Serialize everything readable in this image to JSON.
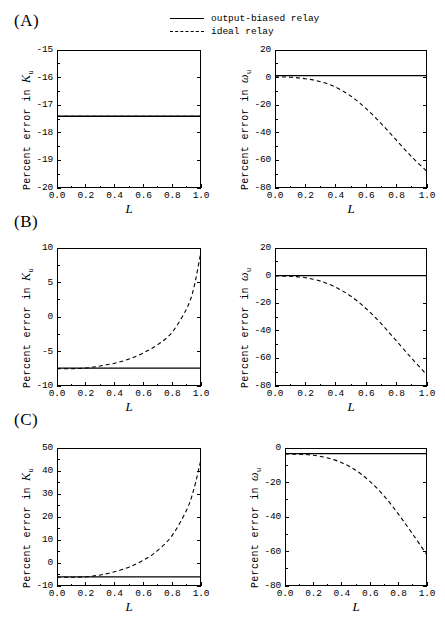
{
  "figure": {
    "legend": {
      "entries": [
        {
          "label": "output-biased relay",
          "style": "solid"
        },
        {
          "label": "ideal relay",
          "style": "dashed"
        }
      ]
    },
    "panels": [
      {
        "id": "A",
        "label": "(A)"
      },
      {
        "id": "B",
        "label": "(B)"
      },
      {
        "id": "C",
        "label": "(C)"
      }
    ]
  },
  "chart_data": [
    {
      "id": "A-left",
      "panel": "(A)",
      "type": "line",
      "title": "",
      "xlabel": "L",
      "ylabel": "Percent error in K_u",
      "ylabel_text": "Percent error in ",
      "ylabel_symbol": "K",
      "ylabel_subscript": "u",
      "xlim": [
        0.0,
        1.0
      ],
      "ylim": [
        -20,
        -15
      ],
      "xticks": [
        0.0,
        0.2,
        0.4,
        0.6,
        0.8,
        1.0
      ],
      "xtick_labels": [
        "0.0",
        "0.2",
        "0.4",
        "0.6",
        "0.8",
        "1.0"
      ],
      "yticks": [
        -20,
        -19,
        -18,
        -17,
        -16,
        -15
      ],
      "ytick_labels": [
        "-20",
        "-19",
        "-18",
        "-17",
        "-16",
        "-15"
      ],
      "grid": false,
      "legend_position": "figure-top",
      "x": [
        0.0,
        0.1,
        0.2,
        0.3,
        0.4,
        0.5,
        0.6,
        0.7,
        0.8,
        0.9,
        1.0
      ],
      "series": [
        {
          "name": "output-biased relay",
          "style": "solid",
          "values": [
            -17.4,
            -17.4,
            -17.4,
            -17.4,
            -17.4,
            -17.4,
            -17.4,
            -17.4,
            -17.4,
            -17.4,
            -17.4
          ]
        },
        {
          "name": "ideal relay",
          "style": "dashed",
          "values": [
            -17.4,
            -17.4,
            -17.4,
            -17.4,
            -17.4,
            -17.4,
            -17.4,
            -17.4,
            -17.4,
            -17.4,
            -17.4
          ]
        }
      ]
    },
    {
      "id": "A-right",
      "panel": "(A)",
      "type": "line",
      "title": "",
      "xlabel": "L",
      "ylabel": "Percent error in omega_u",
      "ylabel_text": "Percent error in ",
      "ylabel_symbol": "ω",
      "ylabel_subscript": "u",
      "xlim": [
        0.0,
        1.0
      ],
      "ylim": [
        -80,
        20
      ],
      "xticks": [
        0.0,
        0.2,
        0.4,
        0.6,
        0.8,
        1.0
      ],
      "xtick_labels": [
        "0.0",
        "0.2",
        "0.4",
        "0.6",
        "0.8",
        "1.0"
      ],
      "yticks": [
        -80,
        -60,
        -40,
        -20,
        0,
        20
      ],
      "ytick_labels": [
        "-80",
        "-60",
        "-40",
        "-20",
        "0",
        "20"
      ],
      "grid": false,
      "legend_position": "figure-top",
      "x": [
        0.0,
        0.1,
        0.2,
        0.3,
        0.4,
        0.5,
        0.6,
        0.7,
        0.8,
        0.9,
        1.0
      ],
      "series": [
        {
          "name": "output-biased relay",
          "style": "solid",
          "values": [
            1.5,
            1.5,
            1.5,
            1.5,
            1.5,
            1.5,
            1.5,
            1.5,
            1.5,
            1.5,
            1.5
          ]
        },
        {
          "name": "ideal relay",
          "style": "dashed",
          "values": [
            0.5,
            0.3,
            -0.8,
            -3.0,
            -7.0,
            -13.5,
            -22.5,
            -33.5,
            -45.5,
            -57.5,
            -68.0
          ]
        }
      ]
    },
    {
      "id": "B-left",
      "panel": "(B)",
      "type": "line",
      "title": "",
      "xlabel": "L",
      "ylabel": "Percent error in K_u",
      "ylabel_text": "Percent error in ",
      "ylabel_symbol": "K",
      "ylabel_subscript": "u",
      "xlim": [
        0.0,
        1.0
      ],
      "ylim": [
        -10,
        10
      ],
      "xticks": [
        0.0,
        0.2,
        0.4,
        0.6,
        0.8,
        1.0
      ],
      "xtick_labels": [
        "0.0",
        "0.2",
        "0.4",
        "0.6",
        "0.8",
        "1.0"
      ],
      "yticks": [
        -10,
        -5,
        0,
        5,
        10
      ],
      "ytick_labels": [
        "-10",
        "-5",
        "0",
        "5",
        "10"
      ],
      "grid": false,
      "legend_position": "figure-top",
      "x": [
        0.0,
        0.1,
        0.2,
        0.3,
        0.4,
        0.5,
        0.6,
        0.7,
        0.8,
        0.9,
        0.95,
        1.0
      ],
      "series": [
        {
          "name": "output-biased relay",
          "style": "solid",
          "values": [
            -7.4,
            -7.4,
            -7.4,
            -7.4,
            -7.4,
            -7.4,
            -7.4,
            -7.4,
            -7.4,
            -7.4,
            -7.4,
            -7.4
          ]
        },
        {
          "name": "ideal relay",
          "style": "dashed",
          "values": [
            -7.5,
            -7.5,
            -7.4,
            -7.1,
            -6.7,
            -6.1,
            -5.2,
            -4.0,
            -2.2,
            1.2,
            4.2,
            9.5
          ]
        }
      ]
    },
    {
      "id": "B-right",
      "panel": "(B)",
      "type": "line",
      "title": "",
      "xlabel": "L",
      "ylabel": "Percent error in omega_u",
      "ylabel_text": "Percent error in ",
      "ylabel_symbol": "ω",
      "ylabel_subscript": "u",
      "xlim": [
        0.0,
        1.0
      ],
      "ylim": [
        -80,
        20
      ],
      "xticks": [
        0.0,
        0.2,
        0.4,
        0.6,
        0.8,
        1.0
      ],
      "xtick_labels": [
        "0.0",
        "0.2",
        "0.4",
        "0.6",
        "0.8",
        "1.0"
      ],
      "yticks": [
        -80,
        -60,
        -40,
        -20,
        0,
        20
      ],
      "ytick_labels": [
        "-80",
        "-60",
        "-40",
        "-20",
        "0",
        "20"
      ],
      "grid": false,
      "legend_position": "figure-top",
      "x": [
        0.0,
        0.1,
        0.2,
        0.3,
        0.4,
        0.5,
        0.6,
        0.7,
        0.8,
        0.9,
        1.0
      ],
      "series": [
        {
          "name": "output-biased relay",
          "style": "solid",
          "values": [
            0.0,
            0.0,
            0.0,
            0.0,
            0.0,
            0.0,
            0.0,
            0.0,
            0.0,
            0.0,
            0.0
          ]
        },
        {
          "name": "ideal relay",
          "style": "dashed",
          "values": [
            -0.3,
            -0.5,
            -1.5,
            -4.0,
            -8.5,
            -15.0,
            -24.0,
            -35.0,
            -47.5,
            -60.0,
            -72.0
          ]
        }
      ]
    },
    {
      "id": "C-left",
      "panel": "(C)",
      "type": "line",
      "title": "",
      "xlabel": "L",
      "ylabel": "Percent error in K_u",
      "ylabel_text": "Percent error in ",
      "ylabel_symbol": "K",
      "ylabel_subscript": "u",
      "xlim": [
        0.0,
        1.0
      ],
      "ylim": [
        -10,
        50
      ],
      "xticks": [
        0.0,
        0.2,
        0.4,
        0.6,
        0.8,
        1.0
      ],
      "xtick_labels": [
        "0.0",
        "0.2",
        "0.4",
        "0.6",
        "0.8",
        "1.0"
      ],
      "yticks": [
        -10,
        0,
        10,
        20,
        30,
        40,
        50
      ],
      "ytick_labels": [
        "-10",
        "0",
        "10",
        "20",
        "30",
        "40",
        "50"
      ],
      "grid": false,
      "legend_position": "figure-top",
      "x": [
        0.0,
        0.1,
        0.2,
        0.3,
        0.4,
        0.5,
        0.6,
        0.7,
        0.8,
        0.9,
        0.95,
        1.0
      ],
      "series": [
        {
          "name": "output-biased relay",
          "style": "solid",
          "values": [
            -6.0,
            -6.0,
            -6.0,
            -6.0,
            -6.0,
            -6.0,
            -6.0,
            -6.0,
            -6.0,
            -6.0,
            -6.0,
            -6.0
          ]
        },
        {
          "name": "ideal relay",
          "style": "dashed",
          "values": [
            -6.2,
            -6.2,
            -6.0,
            -5.2,
            -3.8,
            -1.8,
            1.2,
            5.5,
            12.0,
            23.0,
            32.0,
            45.0
          ]
        }
      ]
    },
    {
      "id": "C-right",
      "panel": "(C)",
      "type": "line",
      "title": "",
      "xlabel": "L",
      "ylabel": "Percent error in omega_u",
      "ylabel_text": "Percent error in ",
      "ylabel_symbol": "ω",
      "ylabel_subscript": "u",
      "xlim": [
        0.0,
        1.0
      ],
      "ylim": [
        -80,
        0
      ],
      "xticks": [
        0.0,
        0.2,
        0.4,
        0.6,
        0.8,
        1.0
      ],
      "xtick_labels": [
        "0.0",
        "0.2",
        "0.4",
        "0.6",
        "0.8",
        "1.0"
      ],
      "yticks": [
        -80,
        -60,
        -40,
        -20,
        0
      ],
      "ytick_labels": [
        "-80",
        "-60",
        "-40",
        "-20",
        "0"
      ],
      "grid": false,
      "legend_position": "figure-top",
      "x": [
        0.0,
        0.1,
        0.2,
        0.3,
        0.4,
        0.5,
        0.6,
        0.7,
        0.8,
        0.9,
        1.0
      ],
      "series": [
        {
          "name": "output-biased relay",
          "style": "solid",
          "values": [
            -3.3,
            -3.3,
            -3.3,
            -3.3,
            -3.3,
            -3.3,
            -3.3,
            -3.3,
            -3.3,
            -3.3,
            -3.3
          ]
        },
        {
          "name": "ideal relay",
          "style": "dashed",
          "values": [
            -3.5,
            -3.6,
            -4.2,
            -5.8,
            -8.5,
            -13.0,
            -19.5,
            -28.0,
            -38.5,
            -50.0,
            -62.0
          ]
        }
      ]
    }
  ]
}
